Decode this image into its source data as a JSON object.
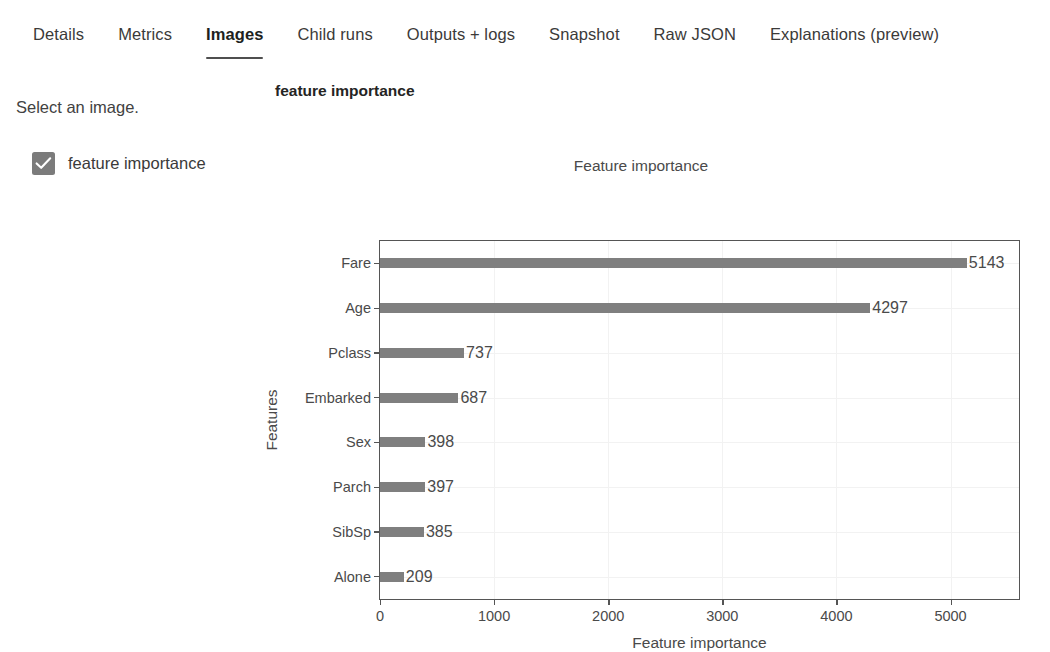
{
  "tabs": [
    {
      "label": "Details",
      "selected": false
    },
    {
      "label": "Metrics",
      "selected": false
    },
    {
      "label": "Images",
      "selected": true
    },
    {
      "label": "Child runs",
      "selected": false
    },
    {
      "label": "Outputs + logs",
      "selected": false
    },
    {
      "label": "Snapshot",
      "selected": false
    },
    {
      "label": "Raw JSON",
      "selected": false
    },
    {
      "label": "Explanations (preview)",
      "selected": false
    }
  ],
  "left_pane": {
    "prompt": "Select an image.",
    "image_item": {
      "label": "feature importance",
      "checked": true,
      "checkbox_color": "#7b7b7b"
    }
  },
  "right_pane": {
    "panel_heading": "feature importance"
  },
  "chart_data": {
    "type": "bar",
    "orientation": "horizontal",
    "title": "Feature importance",
    "xlabel": "Feature importance",
    "ylabel": "Features",
    "categories": [
      "Fare",
      "Age",
      "Pclass",
      "Embarked",
      "Sex",
      "Parch",
      "SibSp",
      "Alone"
    ],
    "values": [
      5143,
      4297,
      737,
      687,
      398,
      397,
      385,
      209
    ],
    "data_labels": [
      "5143",
      "4297",
      "737",
      "687",
      "398",
      "397",
      "385",
      "209"
    ],
    "xlim": [
      0,
      5600
    ],
    "ylim_categories_top_to_bottom": true,
    "xticks": [
      0,
      1000,
      2000,
      3000,
      4000,
      5000
    ],
    "xtick_labels": [
      "0",
      "1000",
      "2000",
      "3000",
      "4000",
      "5000"
    ],
    "grid": true,
    "grid_color": "#f2f2f2",
    "bar_color": "#7f7f7f",
    "axis_color": "#555555",
    "legend": null
  }
}
